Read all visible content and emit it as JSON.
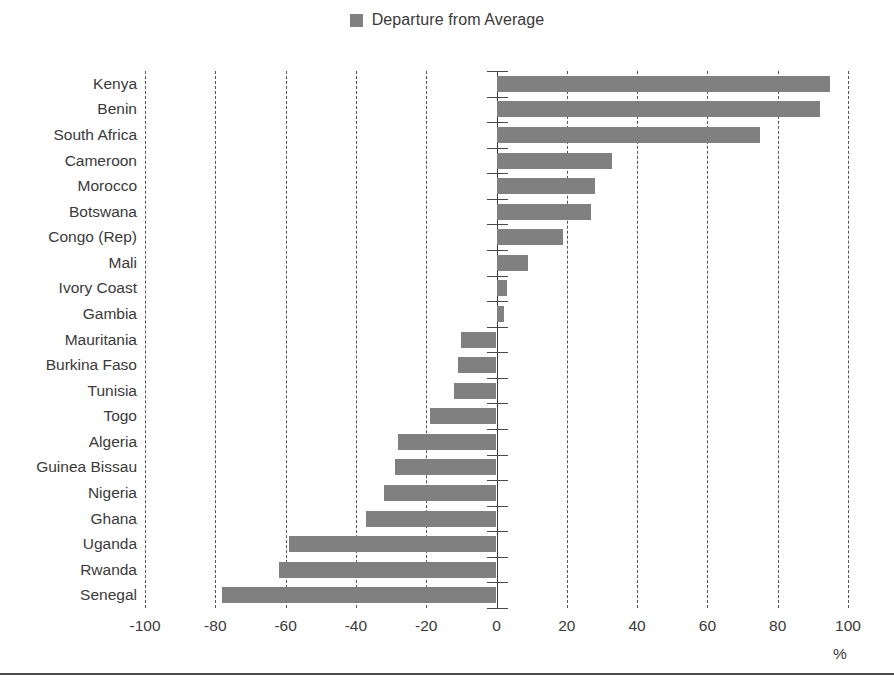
{
  "legend": {
    "swatch_color": "#808080",
    "entries": [
      {
        "label": "Departure from Average",
        "color": "#808080"
      }
    ]
  },
  "axis_unit_label": "%",
  "chart_data": {
    "type": "bar",
    "orientation": "horizontal",
    "title": "",
    "subtitle": "",
    "xlabel": "%",
    "ylabel": "",
    "xlim": [
      -100,
      100
    ],
    "xticks": [
      -100,
      -80,
      -60,
      -40,
      -20,
      0,
      20,
      40,
      60,
      80,
      100
    ],
    "xtick_labels": [
      "-100",
      "-80",
      "-60",
      "-40",
      "-20",
      "0",
      "20",
      "40",
      "60",
      "80",
      "100"
    ],
    "grid": true,
    "grid_style": "dashed",
    "grid_axis": "x",
    "legend_position": "top-center",
    "series_name": "Departure from Average",
    "bar_color": "#808080",
    "categories": [
      "Kenya",
      "Benin",
      "South Africa",
      "Cameroon",
      "Morocco",
      "Botswana",
      "Congo (Rep)",
      "Mali",
      "Ivory Coast",
      "Gambia",
      "Mauritania",
      "Burkina Faso",
      "Tunisia",
      "Togo",
      "Algeria",
      "Guinea Bissau",
      "Nigeria",
      "Ghana",
      "Uganda",
      "Rwanda",
      "Senegal"
    ],
    "values": [
      95,
      92,
      75,
      33,
      28,
      27,
      19,
      9,
      3,
      2,
      -10,
      -11,
      -12,
      -19,
      -28,
      -29,
      -32,
      -37,
      -59,
      -62,
      -78
    ],
    "series": [
      {
        "name": "Departure from Average",
        "color": "#808080",
        "values": [
          95,
          92,
          75,
          33,
          28,
          27,
          19,
          9,
          3,
          2,
          -10,
          -11,
          -12,
          -19,
          -28,
          -29,
          -32,
          -37,
          -59,
          -62,
          -78
        ]
      }
    ]
  }
}
